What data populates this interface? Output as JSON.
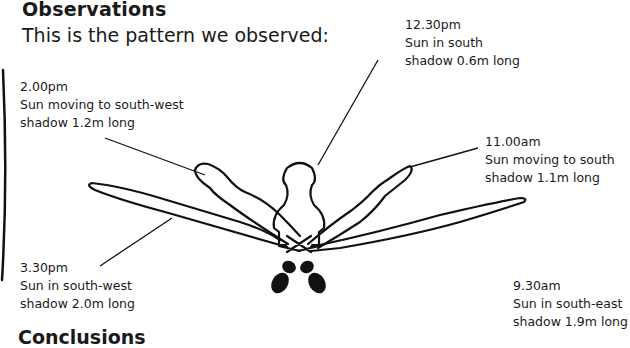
{
  "heading": "Observations",
  "intro": "This is the pattern we observed:",
  "observations": [
    {
      "time": "12.30pm",
      "sun": "Sun in south",
      "shadow": "shadow 0.6m long"
    },
    {
      "time": "2.00pm",
      "sun": "Sun moving to south-west",
      "shadow": "shadow 1.2m long"
    },
    {
      "time": "11.00am",
      "sun": "Sun moving to south",
      "shadow": "shadow 1.1m long"
    },
    {
      "time": "3.30pm",
      "sun": "Sun in south-west",
      "shadow": "shadow 2.0m long"
    },
    {
      "time": "9.30am",
      "sun": "Sun in south-east",
      "shadow": "shadow 1.9m long"
    }
  ],
  "next_heading": "Conclusions"
}
